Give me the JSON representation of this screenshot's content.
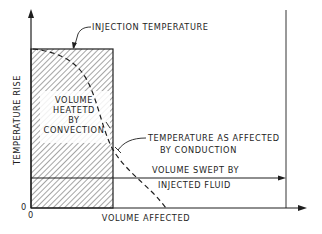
{
  "figure": {
    "type": "schematic",
    "axes": {
      "y_label": "TEMPERATURE RISE",
      "x_label": "VOLUME AFFECTED",
      "y_origin_label": "0",
      "x_origin_label": "0"
    },
    "labels": {
      "injection_temperature": "INJECTION TEMPERATURE",
      "volume_heated": [
        "VOLUME",
        "HEATETD",
        "BY",
        "CONVECTION"
      ],
      "conduction": [
        "TEMPERATURE AS AFFECTED",
        "BY CONDUCTION"
      ],
      "volume_swept": [
        "VOLUME SWEPT BY",
        "INJECTED FLUID"
      ]
    },
    "colors": {
      "ink": "#1e1e1e",
      "background": "#ffffff"
    }
  }
}
